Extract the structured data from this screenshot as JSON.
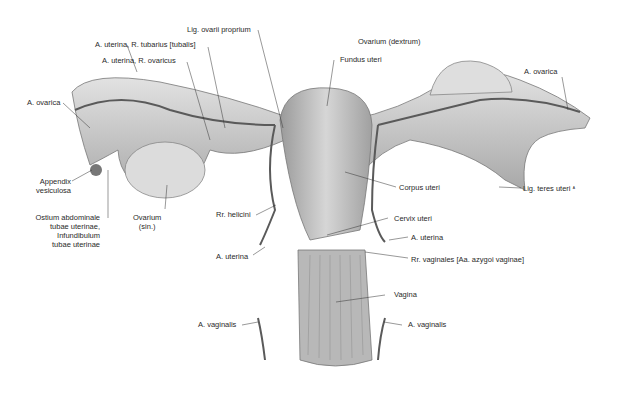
{
  "figure": {
    "colors": {
      "background": "#ffffff",
      "tissue": "#c8c8c8",
      "tissue_dark": "#8a8a8a",
      "vessel": "#5a5a5a",
      "label": "#2a2a2a",
      "leader": "#333333"
    }
  },
  "labels": {
    "lig_ovarii_proprium": "Lig. ovarii proprium",
    "a_uterina_r_tubarius": "A. uterina, R. tubarius [tubalis]",
    "a_uterina_r_ovaricus": "A. uterina, R. ovaricus",
    "ovarium_dextrum": "Ovarium (dextrum)",
    "fundus_uteri": "Fundus uteri",
    "a_ovarica_left": "A. ovarica",
    "a_ovarica_right": "A. ovarica",
    "appendix_vesiculosa": "Appendix\nvesiculosa",
    "ostium_abdominale": "Ostium abdominale\ntubae uterinae,\nInfundibulum\ntubae uterinae",
    "ovarium_sin": "Ovarium\n(sin.)",
    "corpus_uteri": "Corpus uteri",
    "lig_teres_uteri": "Lig. teres uteri",
    "lig_teres_mark": "ᴬ",
    "rr_helicini": "Rr. helicini",
    "cervix_uteri": "Cervix uteri",
    "a_uterina_right": "A. uterina",
    "a_uterina_left": "A. uterina",
    "rr_vaginales": "Rr. vaginales [Aa. azygoi vaginae]",
    "vagina": "Vagina",
    "a_vaginalis_left": "A. vaginalis",
    "a_vaginalis_right": "A. vaginalis"
  }
}
